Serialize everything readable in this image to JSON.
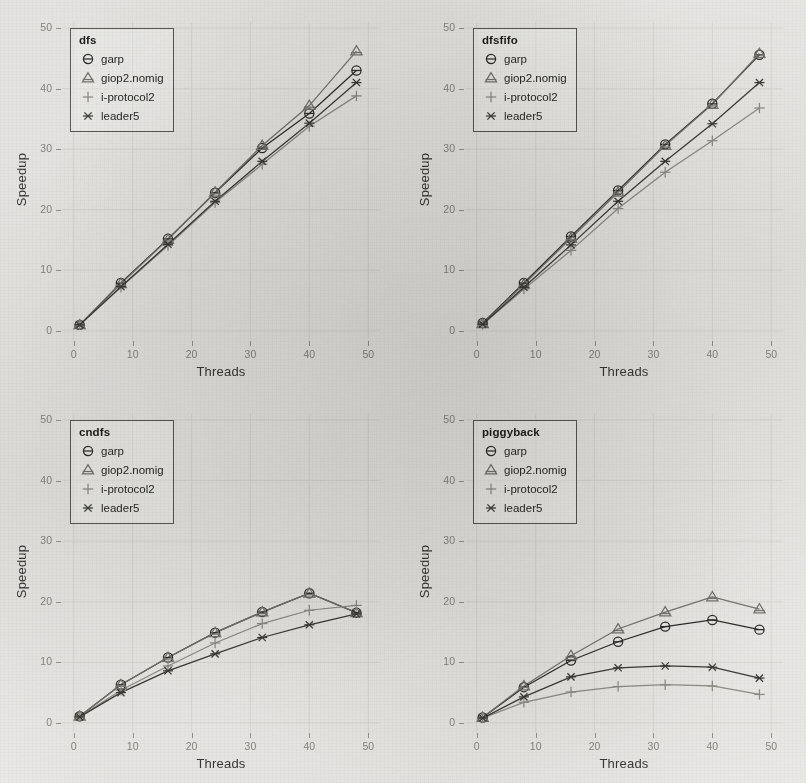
{
  "figure": {
    "background_color": "#f2f1ef",
    "ink_color": "#3a3a38",
    "tick_color": "#8d8b87"
  },
  "axes": {
    "ylabel": "Speedup",
    "xlabel": "Threads",
    "xticks": [
      0,
      10,
      20,
      30,
      40,
      50
    ],
    "yticks": [
      0,
      10,
      20,
      30,
      40,
      50
    ],
    "xlim": [
      -2,
      52
    ],
    "ylim": [
      -1.5,
      51
    ]
  },
  "series_styles": [
    {
      "key": "garp",
      "label": "garp",
      "marker": "circle-hline",
      "color": "#2f2f2d"
    },
    {
      "key": "giop2",
      "label": "giop2.nomig",
      "marker": "triangle-hline",
      "color": "#7b7974"
    },
    {
      "key": "iprotocol2",
      "label": "i-protocol2",
      "marker": "plus",
      "color": "#94928c"
    },
    {
      "key": "leader5",
      "label": "leader5",
      "marker": "asterisk",
      "color": "#3d3d3a"
    }
  ],
  "chart_data": [
    {
      "type": "line",
      "title": "dfs",
      "xlabel": "Threads",
      "ylabel": "Speedup",
      "xlim": [
        -2,
        52
      ],
      "ylim": [
        -1.5,
        51
      ],
      "grid": true,
      "legend_position": "top-left",
      "x": [
        1,
        8,
        16,
        24,
        32,
        40,
        48
      ],
      "series": [
        {
          "name": "garp",
          "values": [
            1.0,
            7.9,
            15.2,
            22.8,
            30.2,
            35.9,
            43.0
          ]
        },
        {
          "name": "giop2.nomig",
          "values": [
            1.0,
            7.8,
            15.1,
            22.9,
            30.6,
            37.2,
            46.2
          ]
        },
        {
          "name": "i-protocol2",
          "values": [
            1.0,
            7.2,
            14.1,
            21.2,
            27.5,
            33.8,
            38.8
          ]
        },
        {
          "name": "leader5",
          "values": [
            1.0,
            7.3,
            14.3,
            21.4,
            28.0,
            34.3,
            41.0
          ]
        }
      ]
    },
    {
      "type": "line",
      "title": "dfsfifo",
      "xlabel": "Threads",
      "ylabel": "Speedup",
      "xlim": [
        -2,
        52
      ],
      "ylim": [
        -1.5,
        51
      ],
      "grid": true,
      "legend_position": "top-left",
      "x": [
        1,
        8,
        16,
        24,
        32,
        40,
        48
      ],
      "series": [
        {
          "name": "garp",
          "values": [
            1.3,
            7.9,
            15.6,
            23.2,
            30.8,
            37.5,
            45.6
          ]
        },
        {
          "name": "giop2.nomig",
          "values": [
            1.2,
            7.7,
            15.3,
            22.9,
            30.6,
            37.4,
            45.8
          ]
        },
        {
          "name": "i-protocol2",
          "values": [
            1.1,
            6.9,
            13.3,
            20.2,
            26.2,
            31.4,
            36.8
          ]
        },
        {
          "name": "leader5",
          "values": [
            1.1,
            7.2,
            14.2,
            21.4,
            28.0,
            34.2,
            41.0
          ]
        }
      ]
    },
    {
      "type": "line",
      "title": "cndfs",
      "xlabel": "Threads",
      "ylabel": "Speedup",
      "xlim": [
        -2,
        52
      ],
      "ylim": [
        -1.5,
        51
      ],
      "grid": true,
      "legend_position": "top-left",
      "x": [
        1,
        8,
        16,
        24,
        32,
        40,
        48
      ],
      "series": [
        {
          "name": "garp",
          "values": [
            1.1,
            6.3,
            10.8,
            14.9,
            18.3,
            21.4,
            18.2
          ]
        },
        {
          "name": "giop2.nomig",
          "values": [
            1.1,
            6.3,
            10.8,
            14.9,
            18.3,
            21.4,
            18.2
          ]
        },
        {
          "name": "i-protocol2",
          "values": [
            1.0,
            5.4,
            9.4,
            13.2,
            16.4,
            18.6,
            19.4
          ]
        },
        {
          "name": "leader5",
          "values": [
            1.0,
            5.0,
            8.6,
            11.4,
            14.1,
            16.2,
            18.0
          ]
        }
      ]
    },
    {
      "type": "line",
      "title": "piggyback",
      "xlabel": "Threads",
      "ylabel": "Speedup",
      "xlim": [
        -2,
        52
      ],
      "ylim": [
        -1.5,
        51
      ],
      "grid": true,
      "legend_position": "top-left",
      "x": [
        1,
        8,
        16,
        24,
        32,
        40,
        48
      ],
      "series": [
        {
          "name": "garp",
          "values": [
            0.9,
            5.9,
            10.3,
            13.4,
            15.9,
            17.0,
            15.4
          ]
        },
        {
          "name": "giop2.nomig",
          "values": [
            0.9,
            6.1,
            11.1,
            15.5,
            18.3,
            20.8,
            18.8
          ]
        },
        {
          "name": "i-protocol2",
          "values": [
            0.8,
            3.4,
            5.1,
            6.0,
            6.3,
            6.1,
            4.7
          ]
        },
        {
          "name": "leader5",
          "values": [
            0.8,
            4.3,
            7.6,
            9.1,
            9.4,
            9.2,
            7.4
          ]
        }
      ]
    }
  ],
  "panels": [
    {
      "title": "dfs"
    },
    {
      "title": "dfsfifo"
    },
    {
      "title": "cndfs"
    },
    {
      "title": "piggyback"
    }
  ],
  "legend_entries": [
    "garp",
    "giop2.nomig",
    "i-protocol2",
    "leader5"
  ]
}
